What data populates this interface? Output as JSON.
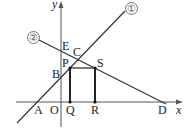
{
  "diagram": {
    "axes": {
      "x_label": "x",
      "y_label": "y",
      "origin_label": "O"
    },
    "lines": [
      {
        "id": "line-1",
        "label": "①"
      },
      {
        "id": "line-2",
        "label": "②"
      }
    ],
    "points": {
      "A": "A",
      "B": "B",
      "C": "C",
      "D": "D",
      "E": "E",
      "P": "P",
      "Q": "Q",
      "R": "R",
      "S": "S"
    },
    "colors": {
      "line": "#333333",
      "axis": "#555555",
      "rect": "#222222"
    }
  }
}
